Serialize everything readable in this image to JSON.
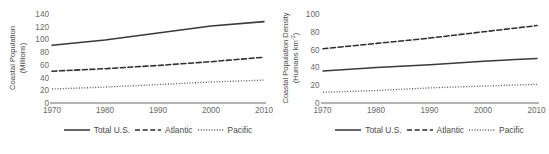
{
  "figure": {
    "panels": [
      {
        "id": "coastal-population",
        "ylabel_line1": "Coastal Population",
        "ylabel_line2": "(Millions)",
        "xlabel": ""
      },
      {
        "id": "coastal-population-density",
        "ylabel_line1": "Coastal Population Density",
        "ylabel_line2": "(Humans km",
        "ylabel_line2_sup": "-2",
        "ylabel_line2_end": ")",
        "xlabel": ""
      }
    ],
    "legend": {
      "items": [
        {
          "label": "Total U.S.",
          "style": "solid",
          "color": "#3a3a3a"
        },
        {
          "label": "Atlantic",
          "style": "dashed",
          "color": "#2e2e2e"
        },
        {
          "label": "Pacific",
          "style": "dotted",
          "color": "#5a5a5a"
        }
      ]
    },
    "axis_color": "#9a9a9a"
  },
  "chart_data": [
    {
      "type": "line",
      "title": "",
      "xlabel": "",
      "ylabel": "Coastal Population (Millions)",
      "x": [
        1970,
        1980,
        1990,
        2000,
        2010
      ],
      "xlim": [
        1970,
        2010
      ],
      "ylim": [
        0,
        140
      ],
      "xticks": [
        1970,
        1980,
        1990,
        2000,
        2010
      ],
      "yticks": [
        0,
        20,
        40,
        60,
        80,
        100,
        120,
        140
      ],
      "grid": false,
      "legend_position": "bottom",
      "series": [
        {
          "name": "Total U.S.",
          "style": "solid",
          "values": [
            91,
            99,
            110,
            121,
            128
          ]
        },
        {
          "name": "Atlantic",
          "style": "dashed",
          "values": [
            50,
            54,
            59,
            65,
            72
          ]
        },
        {
          "name": "Pacific",
          "style": "dotted",
          "values": [
            22,
            25,
            29,
            33,
            36
          ]
        }
      ]
    },
    {
      "type": "line",
      "title": "",
      "xlabel": "",
      "ylabel": "Coastal Population Density (Humans km-2)",
      "x": [
        1970,
        1980,
        1990,
        2000,
        2010
      ],
      "xlim": [
        1970,
        2010
      ],
      "ylim": [
        0,
        100
      ],
      "xticks": [
        1970,
        1980,
        1990,
        2000,
        2010
      ],
      "yticks": [
        0,
        20,
        40,
        60,
        80,
        100
      ],
      "grid": false,
      "legend_position": "bottom",
      "series": [
        {
          "name": "Atlantic",
          "style": "dashed",
          "values": [
            61,
            67,
            73,
            80,
            87
          ]
        },
        {
          "name": "Total U.S.",
          "style": "solid",
          "values": [
            36,
            40,
            43,
            47,
            50
          ]
        },
        {
          "name": "Pacific",
          "style": "dotted",
          "values": [
            12,
            14,
            17,
            19,
            21
          ]
        }
      ]
    }
  ]
}
